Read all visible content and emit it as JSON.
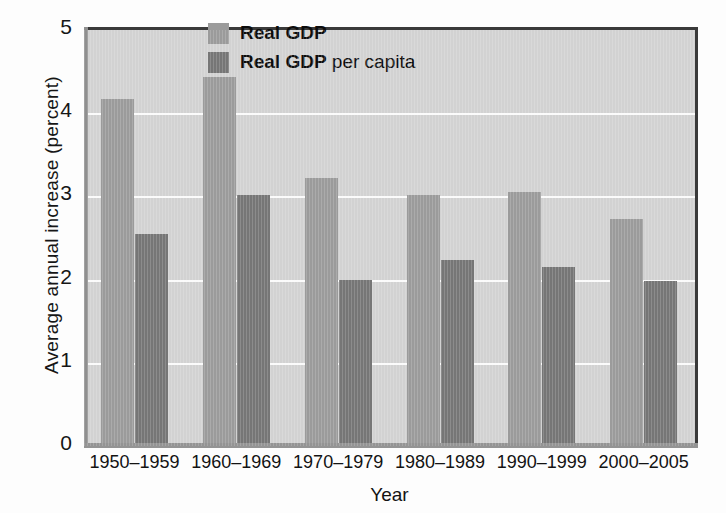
{
  "chart_data": {
    "type": "bar",
    "title": "",
    "xlabel": "Year",
    "ylabel": "Average annual increase (percent)",
    "categories": [
      "1950–1959",
      "1960–1969",
      "1970–1979",
      "1980–1989",
      "1990–1999",
      "2000–2005"
    ],
    "series": [
      {
        "name": "Real GDP",
        "color": "#9b9b9b",
        "values": [
          4.17,
          4.43,
          3.22,
          3.02,
          3.05,
          2.73
        ]
      },
      {
        "name": "Real GDP per capita",
        "color": "#767676",
        "values": [
          2.55,
          3.02,
          2.0,
          2.23,
          2.15,
          1.98
        ]
      }
    ],
    "ylim": [
      0,
      5
    ],
    "yticks": [
      0,
      1,
      2,
      3,
      4,
      5
    ],
    "ytick_labels": [
      "0",
      "1",
      "2",
      "3",
      "4",
      "5"
    ],
    "grid": true,
    "grid_color": "#fbfbfb",
    "legend_position": "top-center",
    "plot_background": "#d2d2d2"
  },
  "legend": {
    "entries": [
      {
        "label": "Real GDP",
        "bold_part": "Real GDP",
        "thin_part": ""
      },
      {
        "label": "Real GDP per capita",
        "bold_part": "Real GDP",
        "thin_part": " per capita"
      }
    ]
  },
  "axes": {
    "y_title": "Average annual increase (percent)",
    "x_title": "Year"
  }
}
